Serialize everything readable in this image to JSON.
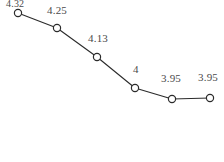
{
  "chart_data": {
    "type": "line",
    "title": "",
    "subtitle": "",
    "xlabel": "",
    "ylabel": "",
    "grid": false,
    "legend": false,
    "legend_position": "none",
    "categories": [
      "1",
      "2",
      "3",
      "4",
      "5",
      "6"
    ],
    "x": [
      1,
      2,
      3,
      4,
      5,
      6
    ],
    "values": [
      4.32,
      4.25,
      4.13,
      4.0,
      3.95,
      3.95
    ],
    "point_labels": [
      "4.32",
      "4.25",
      "4.13",
      "4",
      "3.95",
      "3.95"
    ],
    "label_clipped": [
      true,
      false,
      false,
      false,
      false,
      false
    ],
    "ylim": [
      3.9,
      4.35
    ],
    "series": [
      {
        "name": "series-1",
        "values": [
          4.32,
          4.25,
          4.13,
          4.0,
          3.95,
          3.95
        ]
      }
    ],
    "marker": "open-circle",
    "line_color": "#2b2b2b",
    "marker_fill": "#ffffff",
    "marker_stroke": "#2b2b2b",
    "label_color": "#4a4a4a",
    "background": "#ffffff",
    "pixel_points": [
      {
        "x": 18,
        "y": 13
      },
      {
        "x": 57,
        "y": 28
      },
      {
        "x": 97,
        "y": 57
      },
      {
        "x": 135,
        "y": 88
      },
      {
        "x": 172,
        "y": 99
      },
      {
        "x": 210,
        "y": 98
      }
    ],
    "pixel_labels": [
      {
        "x": 6,
        "y": -1,
        "text": "4.32"
      },
      {
        "x": 47,
        "y": 5,
        "text": "4.25"
      },
      {
        "x": 88,
        "y": 33,
        "text": "4.13"
      },
      {
        "x": 133,
        "y": 64,
        "text": "4"
      },
      {
        "x": 161,
        "y": 73,
        "text": "3.95"
      },
      {
        "x": 198,
        "y": 72,
        "text": "3.95"
      }
    ]
  }
}
